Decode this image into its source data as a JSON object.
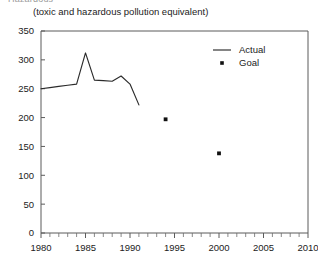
{
  "header": {
    "cut_title": "Hazardous",
    "subtitle": "(toxic and hazardous pollution equivalent)"
  },
  "legend": {
    "position": "top-right",
    "items": [
      {
        "label": "Actual",
        "marker": "line-marker"
      },
      {
        "label": "Goal",
        "marker": "dot-marker"
      }
    ]
  },
  "axes": {
    "y_ticks": [
      "0",
      "50",
      "100",
      "150",
      "200",
      "250",
      "300",
      "350"
    ],
    "x_ticks": [
      "1980",
      "1985",
      "1990",
      "1995",
      "2000",
      "2005",
      "2010"
    ]
  },
  "chart_data": {
    "type": "line",
    "title": "",
    "subtitle": "(toxic and hazardous pollution equivalent)",
    "xlabel": "",
    "ylabel": "",
    "xlim": [
      1980,
      2010
    ],
    "ylim": [
      0,
      350
    ],
    "y_ticks": [
      0,
      50,
      100,
      150,
      200,
      250,
      300,
      350
    ],
    "x_ticks": [
      1980,
      1985,
      1990,
      1995,
      2000,
      2005,
      2010
    ],
    "x_minor_tick_step": 1,
    "grid": false,
    "legend_position": "top-right",
    "series": [
      {
        "name": "Actual",
        "type": "line",
        "color": "#2b2b2b",
        "x": [
          1980,
          1981,
          1982,
          1983,
          1984,
          1985,
          1986,
          1987,
          1988,
          1989,
          1990,
          1991
        ],
        "values": [
          250,
          252,
          254,
          256,
          258,
          312,
          265,
          264,
          263,
          272,
          258,
          222
        ]
      },
      {
        "name": "Goal",
        "type": "scatter",
        "color": "#111111",
        "x": [
          1994,
          2000
        ],
        "values": [
          197,
          138
        ]
      }
    ]
  }
}
